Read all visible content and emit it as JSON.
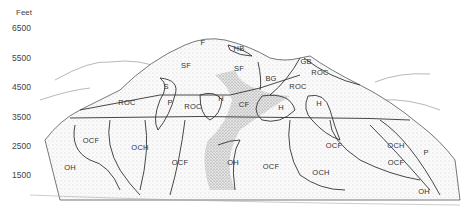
{
  "axis": {
    "title": "Feet",
    "ticks": [
      {
        "label": "6500",
        "y": 29
      },
      {
        "label": "5500",
        "y": 59
      },
      {
        "label": "4500",
        "y": 88
      },
      {
        "label": "3500",
        "y": 118
      },
      {
        "label": "2500",
        "y": 147
      },
      {
        "label": "1500",
        "y": 176
      }
    ]
  },
  "zones": [
    {
      "label": "F",
      "x": 203,
      "y": 42
    },
    {
      "label": "HB",
      "x": 239,
      "y": 48
    },
    {
      "label": "SF",
      "x": 186,
      "y": 65
    },
    {
      "label": "SF",
      "x": 239,
      "y": 68
    },
    {
      "label": "BG",
      "x": 271,
      "y": 78
    },
    {
      "label": "GB",
      "x": 306,
      "y": 61
    },
    {
      "label": "ROC",
      "x": 320,
      "y": 72
    },
    {
      "label": "ROC",
      "x": 298,
      "y": 86
    },
    {
      "label": "S",
      "x": 166,
      "y": 86
    },
    {
      "label": "P",
      "x": 170,
      "y": 102
    },
    {
      "label": "ROC",
      "x": 127,
      "y": 102
    },
    {
      "label": "ROC",
      "x": 193,
      "y": 106
    },
    {
      "label": "H",
      "x": 221,
      "y": 98
    },
    {
      "label": "CF",
      "x": 244,
      "y": 104
    },
    {
      "label": "H",
      "x": 281,
      "y": 107
    },
    {
      "label": "H",
      "x": 319,
      "y": 103
    },
    {
      "label": "OCF",
      "x": 91,
      "y": 140
    },
    {
      "label": "OCH",
      "x": 140,
      "y": 147
    },
    {
      "label": "OCF",
      "x": 180,
      "y": 162
    },
    {
      "label": "OH",
      "x": 70,
      "y": 167
    },
    {
      "label": "OH",
      "x": 233,
      "y": 162
    },
    {
      "label": "OCF",
      "x": 271,
      "y": 166
    },
    {
      "label": "OCF",
      "x": 334,
      "y": 145
    },
    {
      "label": "OCH",
      "x": 321,
      "y": 172
    },
    {
      "label": "OCH",
      "x": 396,
      "y": 145
    },
    {
      "label": "OCF",
      "x": 396,
      "y": 162
    },
    {
      "label": "P",
      "x": 426,
      "y": 152
    },
    {
      "label": "OH",
      "x": 424,
      "y": 191
    }
  ]
}
